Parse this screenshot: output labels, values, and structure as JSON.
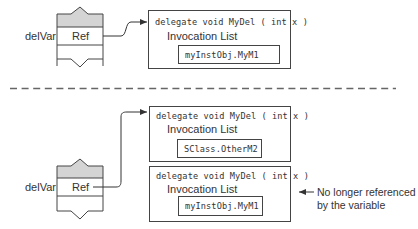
{
  "diagram": {
    "type": "delegate-reference-diagram",
    "colors": {
      "stroke": "#444444",
      "fill_gray": "#d4d4d4",
      "background": "#ffffff",
      "text": "#333333"
    },
    "top": {
      "variable_label": "delVar",
      "ref_label": "Ref",
      "delegate": {
        "signature": "delegate void MyDel ( int x )",
        "invocation_list_label": "Invocation List",
        "methods": [
          "myInstObj.MyM1"
        ]
      }
    },
    "bottom": {
      "variable_label": "delVar",
      "ref_label": "Ref",
      "new_delegate": {
        "signature": "delegate void MyDel ( int x )",
        "invocation_list_label": "Invocation List",
        "methods": [
          "SClass.OtherM2"
        ]
      },
      "old_delegate": {
        "signature": "delegate void MyDel ( int x )",
        "invocation_list_label": "Invocation List",
        "methods": [
          "myInstObj.MyM1"
        ]
      },
      "annotation_line1": "No longer referenced",
      "annotation_line2": "by the variable"
    }
  }
}
